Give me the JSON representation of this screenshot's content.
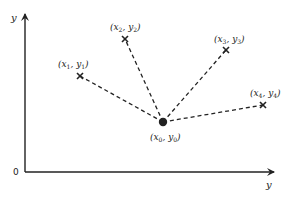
{
  "diagram": {
    "axes": {
      "vertical_label": "y",
      "horizontal_label": "y",
      "origin_label": "0"
    },
    "center": {
      "id": "p0",
      "label_x": "x",
      "label_y": "y",
      "sub": "0",
      "marker": "filled-dot"
    },
    "points": [
      {
        "id": "p1",
        "label_x": "x",
        "label_y": "y",
        "sub": "1",
        "marker": "cross"
      },
      {
        "id": "p2",
        "label_x": "x",
        "label_y": "y",
        "sub": "2",
        "marker": "cross"
      },
      {
        "id": "p3",
        "label_x": "x",
        "label_y": "y",
        "sub": "3",
        "marker": "cross"
      },
      {
        "id": "p4",
        "label_x": "x",
        "label_y": "y",
        "sub": "4",
        "marker": "cross"
      }
    ],
    "connections": [
      {
        "from": "p0",
        "to": "p1",
        "style": "dashed"
      },
      {
        "from": "p0",
        "to": "p2",
        "style": "dashed"
      },
      {
        "from": "p0",
        "to": "p3",
        "style": "dashed"
      },
      {
        "from": "p0",
        "to": "p4",
        "style": "dashed"
      }
    ],
    "colors": {
      "ink": "#222222",
      "background": "#ffffff"
    }
  }
}
